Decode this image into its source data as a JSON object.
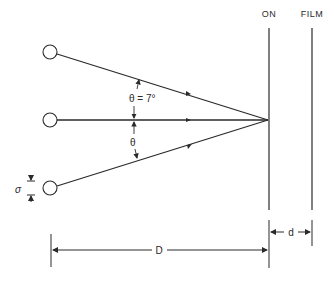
{
  "diagram": {
    "labels": {
      "screen_on": "ON",
      "screen_film": "FILM",
      "angle_value": "θ = 7°",
      "angle_symbol": "θ",
      "source_size": "σ",
      "distance_D": "D",
      "distance_d": "d"
    },
    "sources": [
      {
        "name": "source-top"
      },
      {
        "name": "source-middle"
      },
      {
        "name": "source-bottom"
      }
    ],
    "angle_degrees": 7,
    "colors": {
      "ink": "#2a2a2a",
      "background": "#ffffff"
    }
  }
}
